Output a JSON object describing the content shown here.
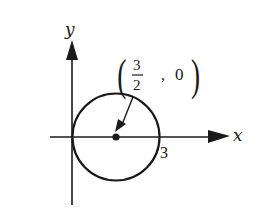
{
  "diagram": {
    "type": "coordinate-circle",
    "axes": {
      "x_label": "x",
      "y_label": "y"
    },
    "circle": {
      "center": [
        1.5,
        0
      ],
      "radius": 1.5,
      "x_intercepts": [
        0,
        3
      ]
    },
    "labels": {
      "center_point": {
        "open_paren": "(",
        "numerator": "3",
        "denominator": "2",
        "comma": ",",
        "y_value": "0",
        "close_paren": ")"
      },
      "intercept": "3"
    },
    "colors": {
      "stroke": "#1a1a1a",
      "background": "#ffffff"
    }
  }
}
